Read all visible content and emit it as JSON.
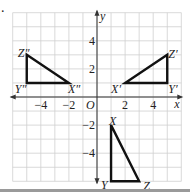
{
  "problem": {
    "marker": "."
  },
  "axes": {
    "x_label": "x",
    "y_label": "y",
    "origin_label": "O",
    "x_ticks": [
      {
        "value": -4,
        "label": "−4"
      },
      {
        "value": -2,
        "label": "−2"
      },
      {
        "value": 2,
        "label": "2"
      },
      {
        "value": 4,
        "label": "4"
      }
    ],
    "y_ticks": [
      {
        "value": 4,
        "label": "4"
      },
      {
        "value": 2,
        "label": "2"
      },
      {
        "value": -2,
        "label": "−2"
      },
      {
        "value": -4,
        "label": "−4"
      }
    ],
    "xlim": [
      -6,
      6
    ],
    "ylim": [
      -6,
      6
    ],
    "grid": true
  },
  "triangles": [
    {
      "name": "XYZ",
      "vertices": [
        {
          "label": "X",
          "x": 1,
          "y": -2
        },
        {
          "label": "Y",
          "x": 1,
          "y": -6
        },
        {
          "label": "Z",
          "x": 3,
          "y": -6
        }
      ]
    },
    {
      "name": "X'Y'Z'",
      "vertices": [
        {
          "label": "X′",
          "x": 2,
          "y": 1
        },
        {
          "label": "Y′",
          "x": 5,
          "y": 1
        },
        {
          "label": "Z′",
          "x": 5,
          "y": 3
        }
      ]
    },
    {
      "name": "X''Y''Z''",
      "vertices": [
        {
          "label": "X″",
          "x": -2,
          "y": 1
        },
        {
          "label": "Y″",
          "x": -5,
          "y": 1
        },
        {
          "label": "Z″",
          "x": -5,
          "y": 3
        }
      ]
    }
  ],
  "colors": {
    "grid": "#cfcfcf",
    "axis": "#333333",
    "triangle": "#111111",
    "separator": "#9a9a9a"
  }
}
